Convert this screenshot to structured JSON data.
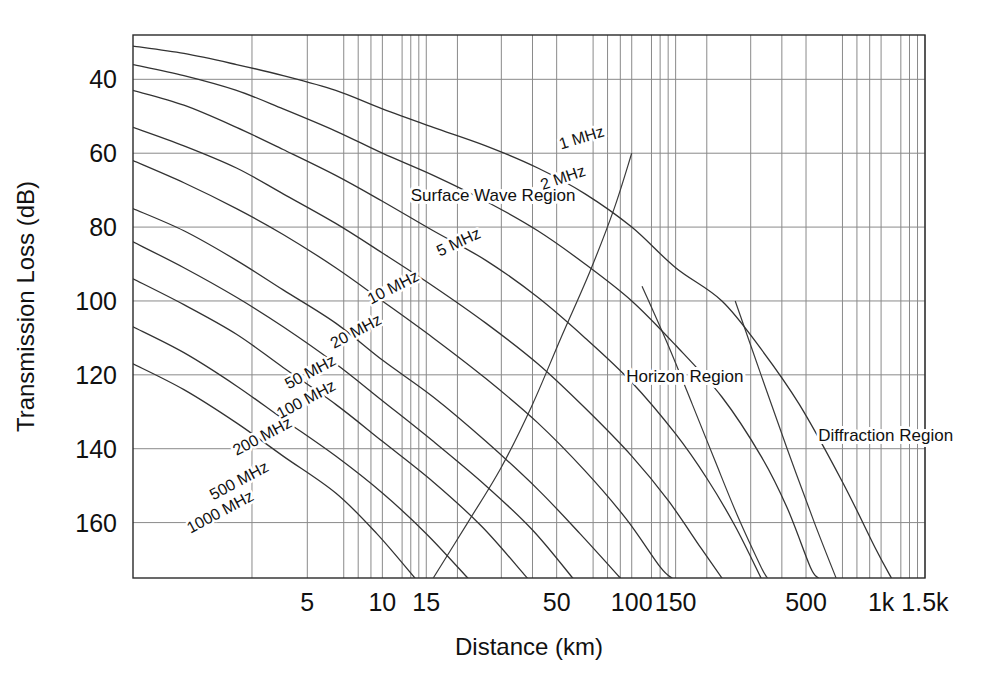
{
  "chart_data": {
    "type": "line",
    "title": "",
    "xlabel": "Distance (km)",
    "ylabel": "Transmission Loss (dB)",
    "xscale": "log",
    "xlim": [
      1,
      1500
    ],
    "ylim": [
      175,
      28
    ],
    "grid": true,
    "legend": "inline-curve-labels",
    "xticks": [
      {
        "value": 5,
        "label": "5"
      },
      {
        "value": 10,
        "label": "10"
      },
      {
        "value": 15,
        "label": "15"
      },
      {
        "value": 50,
        "label": "50"
      },
      {
        "value": 100,
        "label": "100"
      },
      {
        "value": 150,
        "label": "150"
      },
      {
        "value": 500,
        "label": "500"
      },
      {
        "value": 1000,
        "label": "1k"
      },
      {
        "value": 1500,
        "label": "1.5k"
      }
    ],
    "xgridlines": [
      3,
      5,
      7,
      8,
      9,
      10,
      12,
      13,
      14,
      15,
      20,
      30,
      40,
      50,
      70,
      80,
      90,
      100,
      120,
      130,
      140,
      150,
      200,
      300,
      400,
      500,
      700,
      800,
      900,
      1000,
      1200,
      1300,
      1400,
      1500
    ],
    "yticks": [
      {
        "value": 40,
        "label": "40"
      },
      {
        "value": 60,
        "label": "60"
      },
      {
        "value": 80,
        "label": "80"
      },
      {
        "value": 100,
        "label": "100"
      },
      {
        "value": 120,
        "label": "120"
      },
      {
        "value": 140,
        "label": "140"
      },
      {
        "value": 160,
        "label": "160"
      }
    ],
    "region_labels": [
      {
        "text": "Surface Wave Region",
        "x_km": 13,
        "y_db": 73
      },
      {
        "text": "Horizon Region",
        "x_km": 95,
        "y_db": 122
      },
      {
        "text": "Diffraction Region",
        "x_km": 560,
        "y_db": 138
      }
    ],
    "series": [
      {
        "name": "1 MHz",
        "label": "1 MHz",
        "label_x_km": 52,
        "label_y_db": 59,
        "label_rotation": -17,
        "points": [
          [
            1,
            31
          ],
          [
            1.6,
            33
          ],
          [
            2.6,
            36
          ],
          [
            4,
            39
          ],
          [
            6.5,
            43
          ],
          [
            10,
            48
          ],
          [
            16,
            53
          ],
          [
            26,
            58
          ],
          [
            42,
            64
          ],
          [
            65,
            71
          ],
          [
            100,
            80
          ],
          [
            150,
            91
          ],
          [
            230,
            100
          ],
          [
            330,
            113
          ],
          [
            470,
            128
          ],
          [
            700,
            149
          ],
          [
            950,
            167
          ],
          [
            1100,
            175
          ]
        ]
      },
      {
        "name": "2 MHz",
        "label": "2 MHz",
        "label_x_km": 44,
        "label_y_db": 70,
        "label_rotation": -19,
        "points": [
          [
            1,
            36
          ],
          [
            1.6,
            39
          ],
          [
            2.6,
            43
          ],
          [
            4,
            48
          ],
          [
            6.5,
            54
          ],
          [
            10,
            60
          ],
          [
            16,
            66
          ],
          [
            26,
            73
          ],
          [
            42,
            81
          ],
          [
            65,
            90
          ],
          [
            100,
            100
          ],
          [
            150,
            112
          ],
          [
            230,
            126
          ],
          [
            330,
            142
          ],
          [
            420,
            156
          ],
          [
            520,
            172
          ],
          [
            560,
            175
          ]
        ]
      },
      {
        "name": "5 MHz",
        "label": "5 MHz",
        "label_x_km": 17,
        "label_y_db": 88,
        "label_rotation": -25,
        "points": [
          [
            1,
            43
          ],
          [
            1.6,
            47
          ],
          [
            2.6,
            53
          ],
          [
            4,
            59
          ],
          [
            6.5,
            66
          ],
          [
            10,
            73
          ],
          [
            16,
            81
          ],
          [
            26,
            89
          ],
          [
            42,
            99
          ],
          [
            65,
            110
          ],
          [
            100,
            122
          ],
          [
            150,
            136
          ],
          [
            200,
            148
          ],
          [
            260,
            161
          ],
          [
            330,
            175
          ]
        ]
      },
      {
        "name": "10 MHz",
        "label": "10 MHz",
        "label_x_km": 9,
        "label_y_db": 101,
        "label_rotation": -27,
        "points": [
          [
            1,
            53
          ],
          [
            1.6,
            58
          ],
          [
            2.6,
            64
          ],
          [
            4,
            71
          ],
          [
            6.5,
            79
          ],
          [
            10,
            87
          ],
          [
            16,
            96
          ],
          [
            26,
            106
          ],
          [
            42,
            117
          ],
          [
            65,
            129
          ],
          [
            100,
            142
          ],
          [
            140,
            154
          ],
          [
            190,
            167
          ],
          [
            230,
            175
          ]
        ]
      },
      {
        "name": "20 MHz",
        "label": "20 MHz",
        "label_x_km": 6.4,
        "label_y_db": 113,
        "label_rotation": -28,
        "points": [
          [
            1,
            62
          ],
          [
            1.6,
            68
          ],
          [
            2.6,
            75
          ],
          [
            4,
            82
          ],
          [
            6.5,
            91
          ],
          [
            10,
            100
          ],
          [
            16,
            110
          ],
          [
            26,
            121
          ],
          [
            42,
            133
          ],
          [
            65,
            146
          ],
          [
            95,
            159
          ],
          [
            130,
            172
          ],
          [
            145,
            175
          ]
        ]
      },
      {
        "name": "50 MHz",
        "label": "50 MHz",
        "label_x_km": 4.2,
        "label_y_db": 124,
        "label_rotation": -28,
        "points": [
          [
            1,
            75
          ],
          [
            1.6,
            81
          ],
          [
            2.6,
            89
          ],
          [
            4,
            97
          ],
          [
            6.5,
            106
          ],
          [
            10,
            116
          ],
          [
            16,
            126
          ],
          [
            26,
            138
          ],
          [
            42,
            151
          ],
          [
            62,
            163
          ],
          [
            90,
            175
          ]
        ]
      },
      {
        "name": "100 MHz",
        "label": "100 MHz",
        "label_x_km": 3.9,
        "label_y_db": 132,
        "label_rotation": -28,
        "points": [
          [
            1,
            84
          ],
          [
            1.6,
            91
          ],
          [
            2.6,
            99
          ],
          [
            4,
            107
          ],
          [
            6.5,
            117
          ],
          [
            10,
            127
          ],
          [
            16,
            138
          ],
          [
            26,
            150
          ],
          [
            40,
            162
          ],
          [
            58,
            175
          ]
        ]
      },
      {
        "name": "200 MHz",
        "label": "200 MHz",
        "label_x_km": 2.6,
        "label_y_db": 142,
        "label_rotation": -28,
        "points": [
          [
            1,
            94
          ],
          [
            1.6,
            101
          ],
          [
            2.6,
            109
          ],
          [
            4,
            118
          ],
          [
            6.5,
            128
          ],
          [
            10,
            138
          ],
          [
            16,
            149
          ],
          [
            25,
            161
          ],
          [
            37,
            174
          ],
          [
            38,
            175
          ]
        ]
      },
      {
        "name": "500 MHz",
        "label": "500 MHz",
        "label_x_km": 2.1,
        "label_y_db": 154,
        "label_rotation": -28,
        "points": [
          [
            1,
            107
          ],
          [
            1.6,
            114
          ],
          [
            2.6,
            123
          ],
          [
            4,
            132
          ],
          [
            6.5,
            142
          ],
          [
            10,
            152
          ],
          [
            15,
            163
          ],
          [
            22,
            175
          ]
        ]
      },
      {
        "name": "1000 MHz",
        "label": "1000 MHz",
        "label_x_km": 1.7,
        "label_y_db": 163,
        "label_rotation": -28,
        "points": [
          [
            1,
            117
          ],
          [
            1.6,
            124
          ],
          [
            2.6,
            133
          ],
          [
            4,
            142
          ],
          [
            6.5,
            152
          ],
          [
            9.5,
            163
          ],
          [
            13.5,
            175
          ]
        ]
      }
    ],
    "boundary_lines": [
      {
        "name": "horizon-boundary",
        "points": [
          [
            16,
            175
          ],
          [
            22,
            160
          ],
          [
            30,
            145
          ],
          [
            40,
            128
          ],
          [
            52,
            110
          ],
          [
            68,
            92
          ],
          [
            85,
            75
          ],
          [
            100,
            60
          ]
        ]
      },
      {
        "name": "diffraction-boundary",
        "points": [
          [
            110,
            96
          ],
          [
            140,
            112
          ],
          [
            175,
            128
          ],
          [
            215,
            143
          ],
          [
            265,
            158
          ],
          [
            330,
            172
          ],
          [
            350,
            175
          ]
        ]
      },
      {
        "name": "diffraction-edge",
        "points": [
          [
            260,
            100
          ],
          [
            330,
            120
          ],
          [
            420,
            140
          ],
          [
            540,
            160
          ],
          [
            660,
            175
          ]
        ]
      }
    ]
  }
}
